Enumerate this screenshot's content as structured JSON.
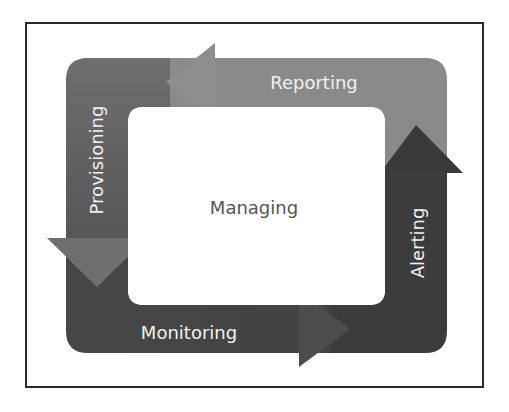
{
  "diagram": {
    "type": "cycle",
    "center_label": "Managing",
    "stages": [
      {
        "label": "Reporting",
        "position": "top",
        "direction": "left"
      },
      {
        "label": "Provisioning",
        "position": "left",
        "direction": "down"
      },
      {
        "label": "Monitoring",
        "position": "bottom",
        "direction": "right"
      },
      {
        "label": "Alerting",
        "position": "right",
        "direction": "up"
      }
    ],
    "colors": {
      "top_band": "#8a8a8a",
      "left_band": "#6a6a6a",
      "bottom_band": "#474747",
      "right_band": "#3c3c3c",
      "text_on_band": "#f2f2f2",
      "center_text": "#555555",
      "frame_border": "#2a2a2a"
    }
  }
}
